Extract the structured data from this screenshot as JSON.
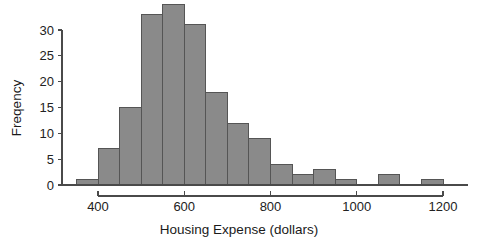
{
  "chart_data": {
    "type": "bar",
    "title": "",
    "subtitle": "",
    "xlabel": "Housing Expense (dollars)",
    "ylabel": "Freqency",
    "xlim": [
      330,
      1210
    ],
    "ylim": [
      0,
      35
    ],
    "grid": false,
    "legend": null,
    "bin_width": 50,
    "xticks": [
      400,
      600,
      800,
      1000,
      1200
    ],
    "xtick_labels": [
      "400",
      "600",
      "800",
      "1000",
      "1200"
    ],
    "yticks": [
      0,
      5,
      10,
      15,
      20,
      25,
      30
    ],
    "ytick_labels": [
      "0",
      "5",
      "10",
      "15",
      "20",
      "25",
      "30"
    ],
    "bin_edges": [
      350,
      400,
      450,
      500,
      550,
      600,
      650,
      700,
      750,
      800,
      850,
      900,
      950,
      1000,
      1050,
      1100,
      1150,
      1200
    ],
    "categories": [
      "350-400",
      "400-450",
      "450-500",
      "500-550",
      "550-600",
      "600-650",
      "650-700",
      "700-750",
      "750-800",
      "800-850",
      "850-900",
      "900-950",
      "950-1000",
      "1000-1050",
      "1050-1100",
      "1100-1150",
      "1150-1200"
    ],
    "values": [
      1,
      7,
      15,
      33,
      35,
      31,
      18,
      12,
      9,
      4,
      2,
      3,
      1,
      0,
      2,
      0,
      1
    ],
    "bar_fill_color": "#8a8a8a",
    "bar_edge_color": "#555555",
    "axis_color": "#4a4a4a",
    "text_color": "#222222",
    "background_color": "#ffffff"
  },
  "axes": {
    "x_label": "Housing Expense (dollars)",
    "y_label": "Freqency"
  }
}
